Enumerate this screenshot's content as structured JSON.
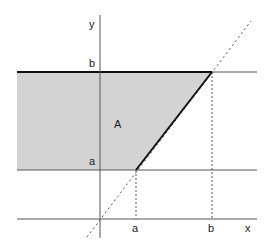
{
  "diagram": {
    "region_label": "A",
    "axis_labels": {
      "x": "x",
      "y": "y"
    },
    "y_ticks": {
      "upper": "b",
      "lower": "a"
    },
    "x_ticks": {
      "left": "a",
      "right": "b"
    },
    "colors": {
      "fill": "#d3d3d3",
      "line": "#111111",
      "thin": "#555555"
    }
  }
}
